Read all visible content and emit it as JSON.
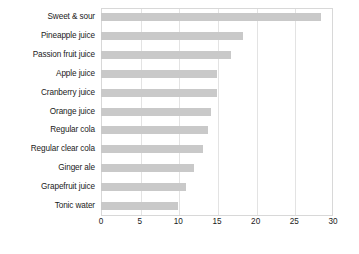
{
  "chart_data": {
    "type": "bar",
    "orientation": "horizontal",
    "title": "",
    "subtitle": "",
    "xlabel": "",
    "ylabel": "",
    "xlim": [
      0,
      30
    ],
    "ylim": null,
    "grid": true,
    "legend": null,
    "legend_position": "none",
    "bar_color": "#c9c9c9",
    "background_color": "#ffffff",
    "axis_color": "#d8d8d8",
    "text_color": "#1a1a1a",
    "xticks": [
      0,
      5,
      10,
      15,
      20,
      25,
      30
    ],
    "xtick_labels": [
      "0",
      "5",
      "10",
      "15",
      "20",
      "25",
      "30"
    ],
    "categories": [
      "Sweet & sour",
      "Pineapple juice",
      "Passion fruit juice",
      "Apple juice",
      "Cranberry juice",
      "Orange juice",
      "Regular cola",
      "Regular clear cola",
      "Ginger ale",
      "Grapefruit juice",
      "Tonic water"
    ],
    "values": [
      28.4,
      18.3,
      16.8,
      15.0,
      15.0,
      14.2,
      13.9,
      13.2,
      12.0,
      11.0,
      10.0
    ]
  }
}
